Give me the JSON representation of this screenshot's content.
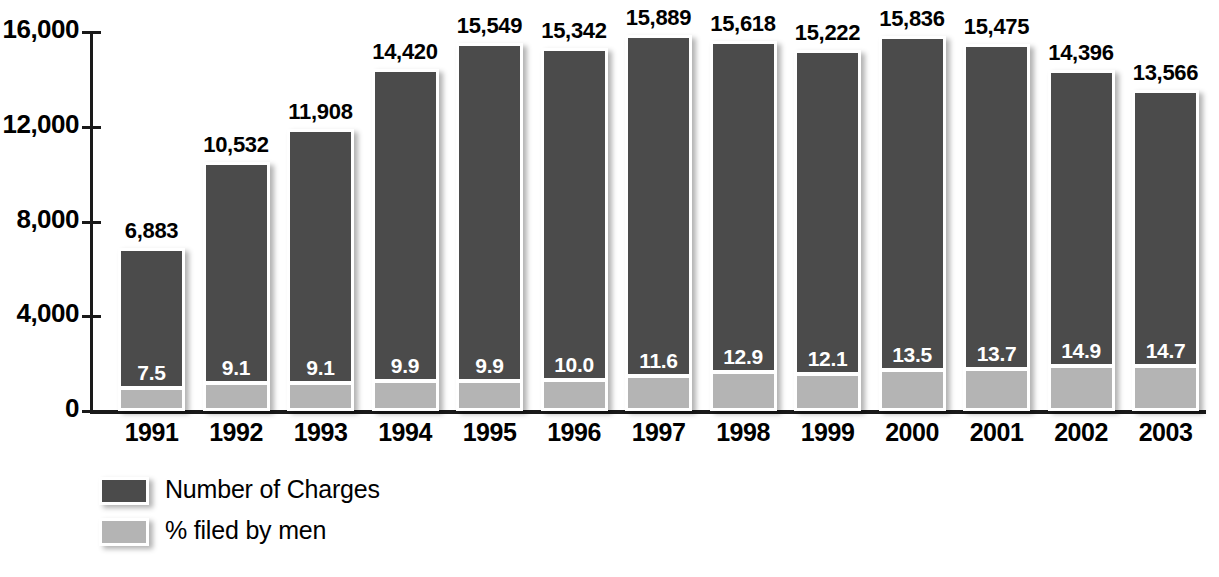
{
  "chart_data": {
    "type": "bar",
    "title": "",
    "subtitle": "",
    "xlabel": "",
    "ylabel": "",
    "ylim": [
      0,
      16000
    ],
    "ytick_labels": [
      "16,000",
      "12,000",
      "8,000",
      "4,000",
      "0"
    ],
    "ytick_values": [
      16000,
      12000,
      8000,
      4000,
      0
    ],
    "grid": false,
    "legend_position": "bottom-left",
    "categories": [
      "1991",
      "1992",
      "1993",
      "1994",
      "1995",
      "1996",
      "1997",
      "1998",
      "1999",
      "2000",
      "2001",
      "2002",
      "2003"
    ],
    "series": [
      {
        "name": "Number of Charges",
        "color": "#4b4b4b",
        "values": [
          6883,
          10532,
          11908,
          14420,
          15549,
          15342,
          15889,
          15618,
          15222,
          15836,
          15475,
          14396,
          13566
        ],
        "value_labels": [
          "6,883",
          "10,532",
          "11,908",
          "14,420",
          "15,549",
          "15,342",
          "15,889",
          "15,618",
          "15,222",
          "15,836",
          "15,475",
          "14,396",
          "13,566"
        ]
      },
      {
        "name": "% filed by men",
        "color": "#b4b4b4",
        "values": [
          7.5,
          9.1,
          9.1,
          9.9,
          9.9,
          10.0,
          11.6,
          12.9,
          12.1,
          13.5,
          13.7,
          14.9,
          14.7
        ],
        "value_labels": [
          "7.5",
          "9.1",
          "9.1",
          "9.9",
          "9.9",
          "10.0",
          "11.6",
          "12.9",
          "12.1",
          "13.5",
          "13.7",
          "14.9",
          "14.7"
        ]
      }
    ]
  },
  "legend": {
    "items": [
      {
        "label": "Number of Charges",
        "color": "#4b4b4b"
      },
      {
        "label": "% filed by men",
        "color": "#b4b4b4"
      }
    ]
  }
}
